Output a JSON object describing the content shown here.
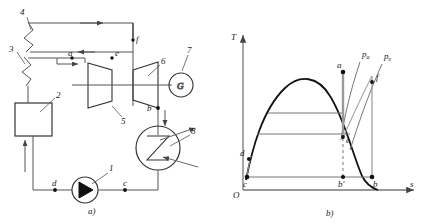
{
  "figure": {
    "panel_a": {
      "caption": "a)",
      "components": [
        {
          "id": "1",
          "name": "pump"
        },
        {
          "id": "2",
          "name": "box-unit"
        },
        {
          "id": "3",
          "name": "lower-zigzag-heater"
        },
        {
          "id": "4",
          "name": "upper-zigzag-heater"
        },
        {
          "id": "5",
          "name": "high-pressure-turbine"
        },
        {
          "id": "6",
          "name": "low-pressure-turbine"
        },
        {
          "id": "7",
          "name": "generator"
        },
        {
          "id": "8",
          "name": "condenser"
        }
      ],
      "generator_symbol": "G",
      "state_points": [
        {
          "label": "a"
        },
        {
          "label": "e"
        },
        {
          "label": "f"
        },
        {
          "label": "b"
        },
        {
          "label": "c"
        },
        {
          "label": "d"
        }
      ]
    },
    "panel_b": {
      "caption": "b)",
      "y_axis_label": "T",
      "x_axis_label": "s",
      "origin_label": "O",
      "isobars": [
        {
          "label": "p",
          "subscript": "a"
        },
        {
          "label": "p",
          "subscript": "e"
        }
      ],
      "state_points": [
        {
          "label": "a"
        },
        {
          "label": "e"
        },
        {
          "label": "f"
        },
        {
          "label": "b"
        },
        {
          "label": "b'"
        },
        {
          "label": "c"
        },
        {
          "label": "d"
        }
      ]
    }
  }
}
